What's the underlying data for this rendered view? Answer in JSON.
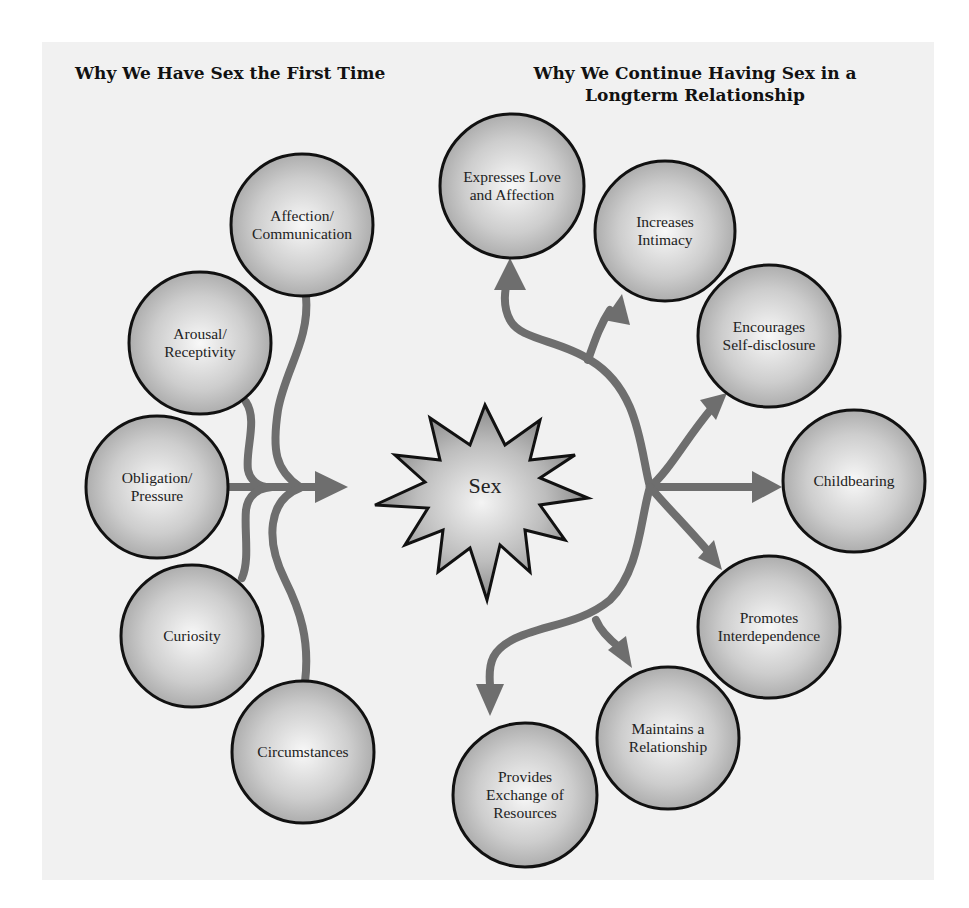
{
  "left_section": {
    "title": "Why We Have Sex the First Time",
    "items": [
      {
        "label": "Affection/\nCommunication",
        "cx": 302,
        "cy": 225,
        "r": 71
      },
      {
        "label": "Arousal/\nReceptivity",
        "cx": 200,
        "cy": 343,
        "r": 71
      },
      {
        "label": "Obligation/\nPressure",
        "cx": 157,
        "cy": 487,
        "r": 71
      },
      {
        "label": "Curiosity",
        "cx": 192,
        "cy": 636,
        "r": 71
      },
      {
        "label": "Circumstances",
        "cx": 303,
        "cy": 752,
        "r": 71
      }
    ]
  },
  "right_section": {
    "title": "Why We Continue Having Sex in a Longterm Relationship",
    "items": [
      {
        "label": "Expresses Love\nand Affection",
        "cx": 512,
        "cy": 186,
        "r": 72
      },
      {
        "label": "Increases\nIntimacy",
        "cx": 665,
        "cy": 231,
        "r": 70
      },
      {
        "label": "Encourages\nSelf-disclosure",
        "cx": 769,
        "cy": 336,
        "r": 71
      },
      {
        "label": "Childbearing",
        "cx": 854,
        "cy": 481,
        "r": 71
      },
      {
        "label": "Promotes\nInterdependence",
        "cx": 769,
        "cy": 627,
        "r": 71
      },
      {
        "label": "Maintains a\nRelationship",
        "cx": 668,
        "cy": 738,
        "r": 71
      },
      {
        "label": "Provides\nExchange of\nResources",
        "cx": 525,
        "cy": 795,
        "r": 72
      }
    ]
  },
  "center": {
    "label": "Sex",
    "cx": 485,
    "cy": 484
  },
  "colors": {
    "panel": "#f1f1f1",
    "arrow": "#6e6e6e",
    "circle_light": "#f6f6f6",
    "circle_dark": "#a9a9a9",
    "outline": "#111111"
  }
}
